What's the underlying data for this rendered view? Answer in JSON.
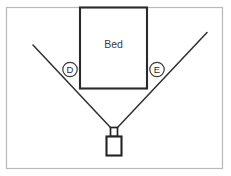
{
  "diagram": {
    "background_color": "#ffffff",
    "frame": {
      "label": "room-outline",
      "stroke_color": "#b9b9b9"
    },
    "bed": {
      "label": "Bed",
      "stroke_color": "#2a2a2a",
      "fill_color": "#ffffff"
    },
    "camera": {
      "label": "camera-sensor",
      "stroke_color": "#232323"
    },
    "field_of_view": {
      "label": "camera-field-of-view",
      "stroke_color": "#2f2f2f",
      "left_ray_label": "left-fov-ray",
      "right_ray_label": "right-fov-ray"
    },
    "callouts": [
      {
        "id": "D",
        "label": "D",
        "name": "callout-d",
        "cx": 70,
        "cy": 69.5,
        "r": 7.2
      },
      {
        "id": "E",
        "label": "E",
        "name": "callout-e",
        "cx": 157,
        "cy": 69.5,
        "r": 7.2
      }
    ]
  },
  "geometry": {
    "frame": {
      "x": 6.5,
      "y": 7.5,
      "width": 216,
      "height": 161
    },
    "bed": {
      "x": 80,
      "y": 7.5,
      "width": 67,
      "height": 81
    },
    "bed_label_pos": {
      "x": 113.5,
      "y": 44
    },
    "fov_left": {
      "x1": 33,
      "y1": 45,
      "x2": 110.5,
      "y2": 127.5
    },
    "fov_right": {
      "x1": 207,
      "y1": 32.5,
      "x2": 117.5,
      "y2": 127.5
    },
    "camera_neck": {
      "x": 110.5,
      "y": 127.5,
      "width": 7,
      "height": 9
    },
    "camera_body": {
      "x": 106.5,
      "y": 136.5,
      "width": 15,
      "height": 19
    }
  }
}
